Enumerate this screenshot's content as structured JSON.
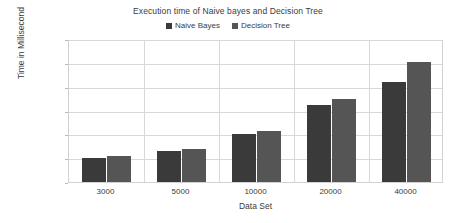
{
  "chart_data": {
    "type": "bar",
    "title": "Execution time of Naive bayes and Decision Tree",
    "xlabel": "Data Set",
    "ylabel": "Time in Millisecond",
    "categories": [
      "3000",
      "5000",
      "10000",
      "20000",
      "40000"
    ],
    "series": [
      {
        "name": "Naive Bayes",
        "color": "#3a3a3a",
        "values": [
          51000,
          65000,
          100000,
          161000,
          210000
        ]
      },
      {
        "name": "Decision Tree",
        "color": "#555555",
        "values": [
          55000,
          69000,
          108000,
          174000,
          252000
        ]
      }
    ],
    "ylim": [
      0,
      300000
    ],
    "ytick_labels": [
      "0",
      "50000",
      "100000",
      "150000",
      "200000",
      "250000",
      "300000"
    ],
    "ytick_values": [
      0,
      50000,
      100000,
      150000,
      200000,
      250000,
      300000
    ],
    "grid": true,
    "legend_position": "top-center"
  }
}
